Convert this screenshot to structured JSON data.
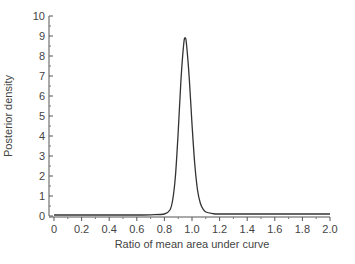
{
  "chart_data": {
    "type": "line",
    "title": "",
    "xlabel": "Ratio of mean area under curve",
    "ylabel": "Posterior density",
    "xlim": [
      0,
      2.0
    ],
    "ylim": [
      0,
      10
    ],
    "x_ticks": [
      "0",
      "0.2",
      "0.4",
      "0.6",
      "0.8",
      "1.0",
      "1.2",
      "1.4",
      "1.6",
      "1.8",
      "2.0"
    ],
    "y_ticks": [
      "0",
      "1",
      "2",
      "3",
      "4",
      "5",
      "6",
      "7",
      "8",
      "9",
      "10"
    ],
    "grid": false,
    "legend": null,
    "series": [
      {
        "name": "posterior density",
        "x": [
          0.0,
          0.2,
          0.4,
          0.6,
          0.7,
          0.8,
          0.84,
          0.86,
          0.88,
          0.9,
          0.92,
          0.94,
          0.95,
          0.96,
          0.98,
          1.0,
          1.02,
          1.04,
          1.06,
          1.08,
          1.1,
          1.15,
          1.2,
          1.4,
          1.6,
          1.8,
          2.0
        ],
        "y": [
          0.05,
          0.05,
          0.05,
          0.05,
          0.06,
          0.1,
          0.3,
          0.8,
          2.0,
          4.2,
          6.8,
          8.6,
          8.9,
          8.6,
          6.9,
          4.6,
          2.6,
          1.3,
          0.65,
          0.35,
          0.2,
          0.12,
          0.1,
          0.1,
          0.1,
          0.1,
          0.1
        ]
      }
    ],
    "peak": {
      "x": 0.95,
      "y": 8.9
    }
  }
}
